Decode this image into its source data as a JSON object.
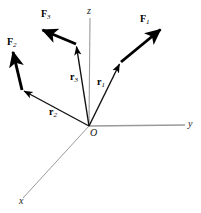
{
  "figure": {
    "type": "vector-diagram",
    "colors": {
      "axis": "#9a9a9a",
      "vector": "#000000",
      "label": "#111111",
      "background": "#ffffff"
    },
    "origin": {
      "label": "O",
      "x": 89,
      "y": 126
    },
    "axes": [
      {
        "name": "z-axis",
        "label": "z",
        "from": [
          89,
          126
        ],
        "to": [
          90,
          18
        ]
      },
      {
        "name": "y-axis",
        "label": "y",
        "from": [
          89,
          126
        ],
        "to": [
          185,
          125
        ]
      },
      {
        "name": "x-axis",
        "label": "x",
        "from": [
          89,
          126
        ],
        "to": [
          23,
          198
        ]
      }
    ],
    "position_vectors": [
      {
        "name": "r1",
        "label": "r",
        "sub": "1",
        "from": [
          89,
          126
        ],
        "to": [
          121,
          62
        ]
      },
      {
        "name": "r2",
        "label": "r",
        "sub": "2",
        "from": [
          89,
          126
        ],
        "to": [
          22,
          90
        ]
      },
      {
        "name": "r3",
        "label": "r",
        "sub": "3",
        "from": [
          89,
          126
        ],
        "to": [
          76,
          44
        ]
      }
    ],
    "force_vectors": [
      {
        "name": "F1",
        "label": "F",
        "sub": "1",
        "from": [
          121,
          62
        ],
        "to": [
          163,
          27
        ]
      },
      {
        "name": "F2",
        "label": "F",
        "sub": "2",
        "from": [
          22,
          90
        ],
        "to": [
          12,
          49
        ]
      },
      {
        "name": "F3",
        "label": "F",
        "sub": "3",
        "from": [
          76,
          44
        ],
        "to": [
          39,
          29
        ]
      }
    ],
    "labels": {
      "F1": "F",
      "F1_sub": "1",
      "F2": "F",
      "F2_sub": "2",
      "F3": "F",
      "F3_sub": "3",
      "r1": "r",
      "r1_sub": "1",
      "r2": "r",
      "r2_sub": "2",
      "r3": "r",
      "r3_sub": "3",
      "axis_x": "x",
      "axis_y": "y",
      "axis_z": "z",
      "origin": "O"
    }
  }
}
